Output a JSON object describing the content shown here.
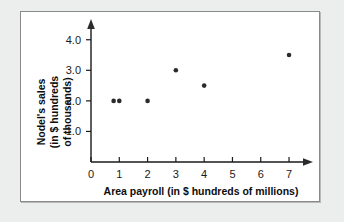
{
  "chart_data": {
    "type": "scatter",
    "title": "",
    "xlabel": "Area payroll (in $ hundreds of millions)",
    "ylabel_lines": [
      "Nodel's sales",
      "(in $ hundreds",
      "of thousands)"
    ],
    "ylabel": "Nodel's sales (in $ hundreds of thousands)",
    "x": [
      0.8,
      1,
      2,
      3,
      4,
      7
    ],
    "y": [
      2.0,
      2.0,
      2.0,
      3.0,
      2.5,
      3.5
    ],
    "points": [
      {
        "x": 0.8,
        "y": 2.0
      },
      {
        "x": 1,
        "y": 2.0
      },
      {
        "x": 2,
        "y": 2.0
      },
      {
        "x": 3,
        "y": 3.0
      },
      {
        "x": 4,
        "y": 2.5
      },
      {
        "x": 7,
        "y": 3.5
      }
    ],
    "xticks": [
      "0",
      "1",
      "2",
      "3",
      "4",
      "5",
      "6",
      "7"
    ],
    "xtick_values": [
      0,
      1,
      2,
      3,
      4,
      5,
      6,
      7
    ],
    "yticks": [
      "1.0",
      "2.0",
      "3.0",
      "4.0"
    ],
    "ytick_values": [
      1.0,
      2.0,
      3.0,
      4.0
    ],
    "xlim": [
      0,
      7.6
    ],
    "ylim": [
      0,
      4.45
    ],
    "grid": false,
    "legend": false,
    "marker_color": "#2b2b2b",
    "axis_color": "#1a1a1a",
    "panel_background": "#ffffff",
    "page_background": "#eceded",
    "panel_border_color": "#8a8a8a",
    "x_axis_arrow": true,
    "y_axis_arrow": true
  }
}
